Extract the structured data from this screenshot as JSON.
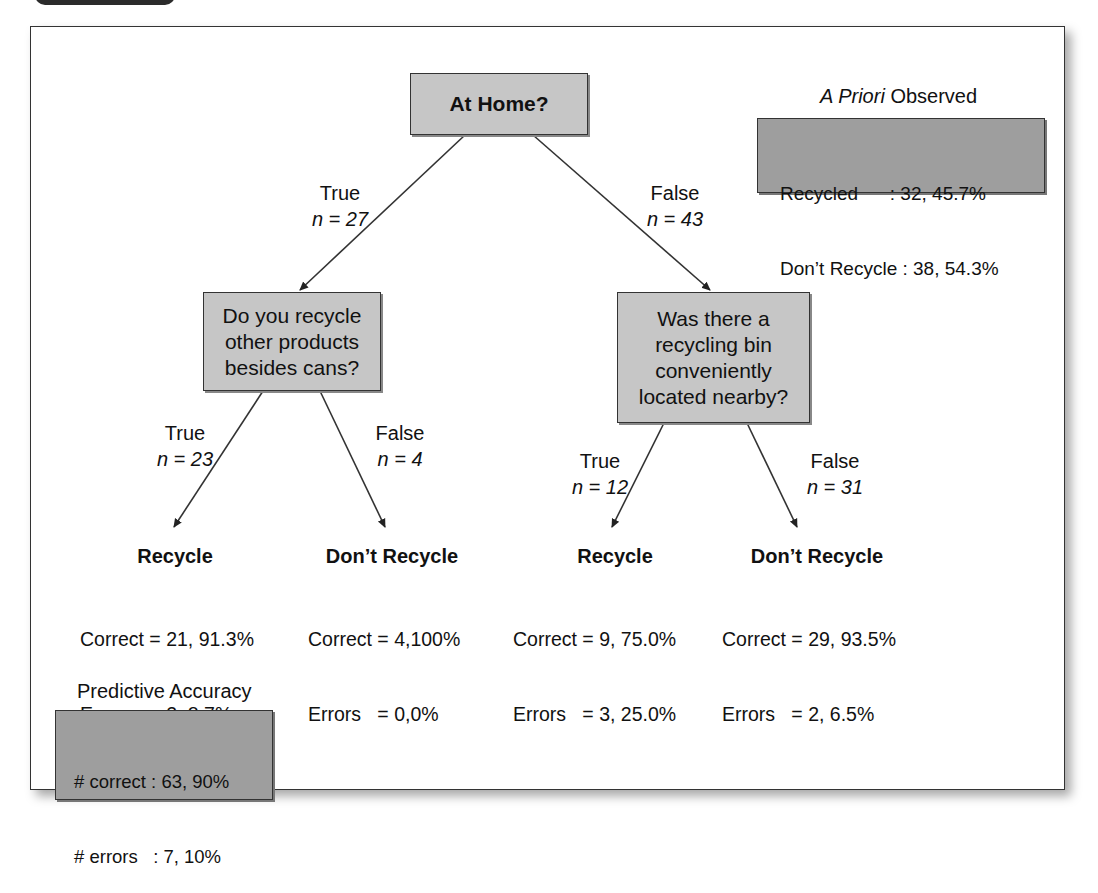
{
  "root": {
    "question": "At Home?"
  },
  "branches": {
    "root_true": {
      "label": "True",
      "n": "n = 27"
    },
    "root_false": {
      "label": "False",
      "n": "n = 43"
    },
    "left_true": {
      "label": "True",
      "n": "n = 23"
    },
    "left_false": {
      "label": "False",
      "n": "n = 4"
    },
    "right_true": {
      "label": "True",
      "n": "n = 12"
    },
    "right_false": {
      "label": "False",
      "n": "n = 31"
    }
  },
  "nodes": {
    "left": {
      "question": "Do you recycle other products besides cans?"
    },
    "right": {
      "question": "Was there a recycling bin conveniently located nearby?"
    }
  },
  "leaves": [
    {
      "title": "Recycle",
      "correct": "Correct = 21, 91.3%",
      "errors": "Errors   = 2, 8.7%"
    },
    {
      "title": "Don’t Recycle",
      "correct": "Correct = 4,100%",
      "errors": "Errors   = 0,0%"
    },
    {
      "title": "Recycle",
      "correct": "Correct = 9, 75.0%",
      "errors": "Errors   = 3, 25.0%"
    },
    {
      "title": "Don’t Recycle",
      "correct": "Correct = 29, 93.5%",
      "errors": "Errors   = 2, 6.5%"
    }
  ],
  "a_priori": {
    "title_italic": "A Priori",
    "title_rest": " Observed",
    "line1": "Recycled      : 32, 45.7%",
    "line2": "Don’t Recycle : 38, 54.3%"
  },
  "predictive_accuracy": {
    "title": "Predictive Accuracy",
    "line1": "# correct : 63, 90%",
    "line2": "# errors   : 7, 10%",
    "tau_label": "Tau",
    "tau_value": " = .78"
  },
  "colors": {
    "node_fill": "#c6c6c6",
    "summary_fill": "#9e9e9e",
    "border": "#333333"
  }
}
